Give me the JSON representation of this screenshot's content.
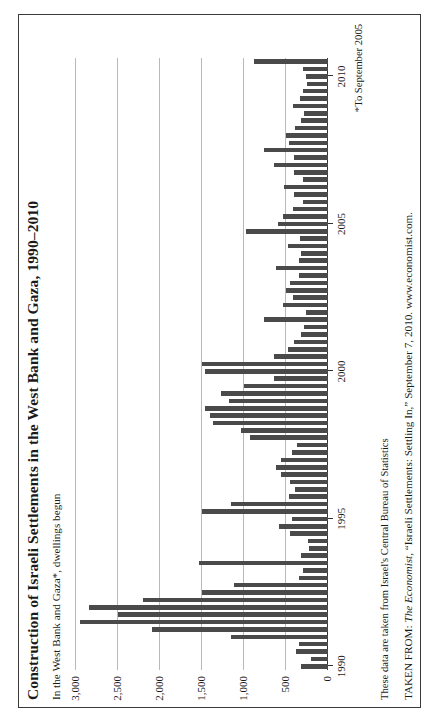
{
  "figure": {
    "title": "Construction of Israeli Settlements in the West Bank and Gaza, 1990–2010",
    "subtitle": "In the West Bank and Gaza*, dwellings begun",
    "footnote": "*To September 2005",
    "note": "These data are taken from Israel's Central Bureau of Statistics",
    "source_prefix": "TAKEN FROM: ",
    "source_italic": "The Economist",
    "source_rest": ", “Israeli Settlements: Settling In,” September 7, 2010. www.economist.com."
  },
  "style": {
    "bar_color": "#4a4a4a",
    "grid_color": "#b9b9b9",
    "axis_color": "#333333",
    "frame_color": "#3a3a3a"
  },
  "chart_data": {
    "type": "bar",
    "title": "Construction of Israeli Settlements in the West Bank and Gaza, 1990–2010",
    "subtitle": "In the West Bank and Gaza*, dwellings begun",
    "xlabel": "",
    "ylabel": "dwellings begun",
    "ylim": [
      0,
      3000
    ],
    "yticks": [
      0,
      500,
      1000,
      1500,
      2000,
      2500,
      3000
    ],
    "ytick_labels": [
      "0",
      "500",
      "1,000",
      "1,500",
      "2,000",
      "2,500",
      "3,000"
    ],
    "xticks": [
      1990,
      1995,
      2000,
      2005,
      2010
    ],
    "xtick_labels": [
      "1990",
      "1995",
      "2000",
      "2005",
      "2010"
    ],
    "grid": true,
    "legend": "none",
    "series_note": "quarterly dwelling starts, 1990 Q1 – 2010 Q3",
    "categories": [
      "1990 Q1",
      "1990 Q2",
      "1990 Q3",
      "1990 Q4",
      "1991 Q1",
      "1991 Q2",
      "1991 Q3",
      "1991 Q4",
      "1992 Q1",
      "1992 Q2",
      "1992 Q3",
      "1992 Q4",
      "1993 Q1",
      "1993 Q2",
      "1993 Q3",
      "1993 Q4",
      "1994 Q1",
      "1994 Q2",
      "1994 Q3",
      "1994 Q4",
      "1995 Q1",
      "1995 Q2",
      "1995 Q3",
      "1995 Q4",
      "1996 Q1",
      "1996 Q2",
      "1996 Q3",
      "1996 Q4",
      "1997 Q1",
      "1997 Q2",
      "1997 Q3",
      "1997 Q4",
      "1998 Q1",
      "1998 Q2",
      "1998 Q3",
      "1998 Q4",
      "1999 Q1",
      "1999 Q2",
      "1999 Q3",
      "1999 Q4",
      "2000 Q1",
      "2000 Q2",
      "2000 Q3",
      "2000 Q4",
      "2001 Q1",
      "2001 Q2",
      "2001 Q3",
      "2001 Q4",
      "2002 Q1",
      "2002 Q2",
      "2002 Q3",
      "2002 Q4",
      "2003 Q1",
      "2003 Q2",
      "2003 Q3",
      "2003 Q4",
      "2004 Q1",
      "2004 Q2",
      "2004 Q3",
      "2004 Q4",
      "2005 Q1",
      "2005 Q2",
      "2005 Q3",
      "2005 Q4",
      "2006 Q1",
      "2006 Q2",
      "2006 Q3",
      "2006 Q4",
      "2007 Q1",
      "2007 Q2",
      "2007 Q3",
      "2007 Q4",
      "2008 Q1",
      "2008 Q2",
      "2008 Q3",
      "2008 Q4",
      "2009 Q1",
      "2009 Q2",
      "2009 Q3",
      "2009 Q4",
      "2010 Q1",
      "2010 Q2",
      "2010 Q3"
    ],
    "values": [
      320,
      200,
      380,
      340,
      1150,
      2100,
      2950,
      2500,
      2850,
      2200,
      1500,
      1120,
      340,
      300,
      1530,
      320,
      230,
      240,
      450,
      580,
      430,
      1500,
      1160,
      470,
      390,
      450,
      560,
      620,
      560,
      430,
      370,
      930,
      1030,
      1370,
      1400,
      1460,
      1180,
      1270,
      1000,
      640,
      1460,
      1500,
      640,
      480,
      400,
      320,
      290,
      760,
      260,
      530,
      420,
      500,
      450,
      340,
      620,
      340,
      320,
      480,
      330,
      980,
      600,
      530,
      420,
      300,
      400,
      520,
      300,
      400,
      640,
      400,
      760,
      470,
      500,
      390,
      320,
      280,
      420,
      330,
      300,
      250,
      260,
      300,
      880
    ]
  }
}
